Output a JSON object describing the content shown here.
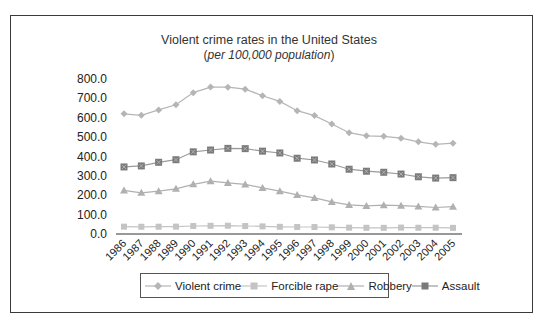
{
  "chart_data": {
    "type": "line",
    "title": "Violent crime rates in the United States",
    "subtitle": "per 100,000 population",
    "xlabel": "",
    "ylabel": "",
    "ylim": [
      0,
      800
    ],
    "yticks": [
      "0.0",
      "100.0",
      "200.0",
      "300.0",
      "400.0",
      "500.0",
      "600.0",
      "700.0",
      "800.0"
    ],
    "grid": false,
    "legend_position": "bottom",
    "categories": [
      "1986",
      "1987",
      "1988",
      "1989",
      "1990",
      "1991",
      "1992",
      "1993",
      "1994",
      "1995",
      "1996",
      "1997",
      "1998",
      "1999",
      "2000",
      "2001",
      "2002",
      "2003",
      "2004",
      "2005"
    ],
    "series": [
      {
        "name": "Violent crime",
        "marker": "diamond",
        "color": "#b5b5b5",
        "values": [
          620.1,
          612.5,
          640.6,
          666.9,
          729.6,
          758.2,
          757.7,
          747.1,
          713.6,
          684.5,
          636.6,
          611.0,
          567.6,
          523.0,
          506.5,
          504.5,
          494.4,
          475.8,
          463.2,
          469.0
        ]
      },
      {
        "name": "Forcible rape",
        "marker": "square",
        "color": "#c4c4c4",
        "values": [
          37.9,
          37.4,
          37.6,
          38.1,
          41.1,
          42.3,
          42.8,
          41.1,
          39.3,
          37.1,
          36.3,
          35.9,
          34.5,
          32.8,
          32.0,
          31.8,
          33.1,
          32.3,
          32.4,
          31.7
        ]
      },
      {
        "name": "Robbery",
        "marker": "triangle",
        "color": "#b0b0b0",
        "values": [
          225.1,
          212.7,
          220.9,
          233.0,
          256.3,
          272.7,
          263.7,
          256.0,
          237.8,
          220.9,
          201.9,
          186.2,
          165.5,
          150.1,
          145.0,
          148.5,
          146.1,
          142.5,
          136.7,
          140.7
        ]
      },
      {
        "name": "Assault",
        "marker": "square-x",
        "color": "#7a7a7a",
        "values": [
          346.1,
          351.3,
          370.2,
          383.4,
          424.1,
          433.4,
          441.9,
          440.5,
          427.6,
          418.3,
          391.0,
          382.1,
          361.4,
          334.3,
          324.0,
          318.6,
          309.5,
          295.4,
          288.6,
          290.8
        ]
      }
    ]
  },
  "legend": {
    "items": [
      {
        "label": "Violent crime"
      },
      {
        "label": "Forcible rape"
      },
      {
        "label": "Robbery"
      },
      {
        "label": "Assault"
      }
    ]
  }
}
